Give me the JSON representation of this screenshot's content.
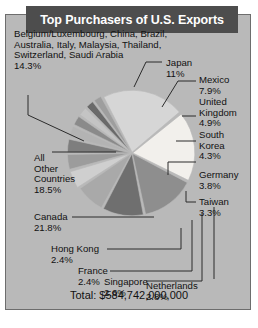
{
  "figure": {
    "title": "Top Purchasers of U.S. Exports",
    "total": "Total: $584,742,000,000"
  },
  "labels": {
    "group": "Belgium/Luxembourg, China, Brazil,\nAustralia, Italy, Malaysia, Thailand,\nSwitzerland, Saudi Arabia\n14.3%",
    "japan": "Japan\n11%",
    "mexico": "Mexico\n7.9%",
    "united_kingdom": "United\nKingdom\n4.9%",
    "south_korea": "South\nKorea\n4.3%",
    "germany": "Germany\n3.8%",
    "taiwan": "Taiwan\n3.3%",
    "all_other": "All\nOther\nCountries\n18.5%",
    "canada": "Canada\n21.8%",
    "hong_kong": "Hong Kong\n2.4%",
    "france": "France\n2.4%",
    "singapore": "Singapore\n2.6%",
    "netherlands": "Netherlands\n2.8%"
  },
  "chart_data": {
    "type": "pie",
    "title": "Top Purchasers of U.S. Exports",
    "total_label": "Total: $584,742,000,000",
    "total_value": 584742000000,
    "units": "USD",
    "legend": "none",
    "labels_position": "outside-with-leader-lines",
    "categories": [
      "Canada",
      "All Other Countries",
      "Belgium/Luxembourg, China, Brazil, Australia, Italy, Malaysia, Thailand, Switzerland, Saudi Arabia",
      "Japan",
      "Mexico",
      "United Kingdom",
      "South Korea",
      "Germany",
      "Taiwan",
      "Netherlands",
      "Singapore",
      "France",
      "Hong Kong"
    ],
    "values": [
      21.8,
      18.5,
      14.3,
      11,
      7.9,
      4.9,
      4.3,
      3.8,
      3.3,
      2.8,
      2.6,
      2.4,
      2.4
    ],
    "value_labels": [
      "21.8%",
      "18.5%",
      "14.3%",
      "11%",
      "7.9%",
      "4.9%",
      "4.3%",
      "3.8%",
      "3.3%",
      "2.8%",
      "2.6%",
      "2.4%",
      "2.4%"
    ],
    "value_unit": "percent",
    "colors": [
      "#d6d6d6",
      "#f2f0ec",
      "#8e8e8e",
      "#6f6f6f",
      "#a9a9a9",
      "#cfcfcf",
      "#9c9c9c",
      "#7e7e7e",
      "#b3b3b3",
      "#8a8a8a",
      "#c4c4c4",
      "#6a6a6a",
      "#9e9e9e"
    ]
  },
  "colors": {
    "frame_background": "#b9b9b9",
    "frame_border": "#6d6d6d",
    "title_background": "#4d4d4d",
    "title_text": "#ffffff",
    "label_text": "#111111",
    "leader_line": "#2b2b2b"
  }
}
